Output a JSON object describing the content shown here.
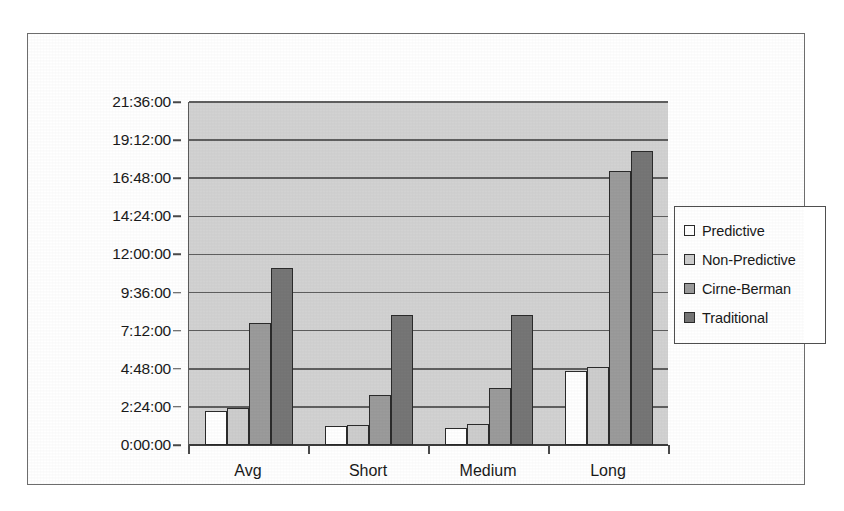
{
  "chart_data": {
    "type": "bar",
    "title": "",
    "xlabel": "",
    "ylabel": "",
    "grid": true,
    "legend_position": "right",
    "categories": [
      "Avg",
      "Short",
      "Medium",
      "Long"
    ],
    "ytick_labels": [
      "0:00:00",
      "2:24:00",
      "4:48:00",
      "7:12:00",
      "9:36:00",
      "12:00:00",
      "14:24:00",
      "16:48:00",
      "19:12:00",
      "21:36:00"
    ],
    "ytick_hours": [
      0,
      2.4,
      4.8,
      7.2,
      9.6,
      12.0,
      14.4,
      16.8,
      19.2,
      21.6
    ],
    "ylim_hours": [
      0,
      21.6
    ],
    "value_unit": "hours",
    "series": [
      {
        "name": "Predictive",
        "color": "#ffffff",
        "values_hours": [
          2.17,
          1.17,
          1.08,
          4.67
        ],
        "values_time": [
          "2:10:00",
          "1:10:00",
          "1:05:00",
          "4:40:00"
        ]
      },
      {
        "name": "Non-Predictive",
        "color": "#cdcdcd",
        "values_hours": [
          2.33,
          1.25,
          1.33,
          4.92
        ],
        "values_time": [
          "2:20:00",
          "1:15:00",
          "1:20:00",
          "4:55:00"
        ]
      },
      {
        "name": "Cirne-Berman",
        "color": "#9b9b9b",
        "values_hours": [
          7.67,
          3.17,
          3.58,
          17.25
        ],
        "values_time": [
          "7:40:00",
          "3:10:00",
          "3:35:00",
          "17:15:00"
        ]
      },
      {
        "name": "Traditional",
        "color": "#767676",
        "values_hours": [
          11.17,
          8.17,
          8.17,
          18.5
        ],
        "values_time": [
          "11:10:00",
          "8:10:00",
          "8:10:00",
          "18:30:00"
        ]
      }
    ]
  },
  "legend": {
    "items": [
      {
        "label": "Predictive"
      },
      {
        "label": "Non-Predictive"
      },
      {
        "label": "Cirne-Berman"
      },
      {
        "label": "Traditional"
      }
    ]
  },
  "style": {
    "plot_background": "#d2d2d2",
    "gridline_color": "#5f5f5f",
    "frame_color": "#6d6d6d",
    "text_color": "#1a1a1a"
  }
}
